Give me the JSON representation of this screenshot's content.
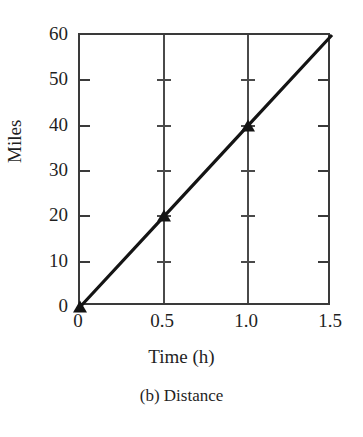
{
  "chart_data": {
    "type": "line",
    "title": "",
    "caption": "(b) Distance",
    "xlabel": "Time (h)",
    "ylabel": "Miles",
    "xlim": [
      0,
      1.5
    ],
    "ylim": [
      0,
      60
    ],
    "grid": "vertical gridlines at x = 0.5 and x = 1.0",
    "legend": "none",
    "x_ticks": [
      0,
      0.5,
      1.0,
      1.5
    ],
    "x_tick_labels": [
      "0",
      "0.5",
      "1.0",
      "1.5"
    ],
    "y_ticks": [
      0,
      10,
      20,
      30,
      40,
      50,
      60
    ],
    "y_tick_labels": [
      "0",
      "10",
      "20",
      "30",
      "40",
      "50",
      "60"
    ],
    "series": [
      {
        "name": "Distance",
        "marker": "triangle",
        "color": "#141414",
        "x": [
          0,
          0.5,
          1.0,
          1.5
        ],
        "y": [
          0,
          20,
          40,
          60
        ],
        "marker_points": [
          {
            "x": 0,
            "y": 0
          },
          {
            "x": 0.5,
            "y": 20
          },
          {
            "x": 1.0,
            "y": 40
          }
        ]
      }
    ]
  },
  "figure": {
    "frame_color": "#3a3a3a",
    "grid_color": "#4a4a4a",
    "background": "#ffffff"
  }
}
